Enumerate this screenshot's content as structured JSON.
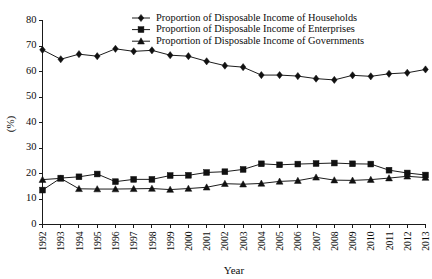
{
  "chart_data": {
    "type": "line",
    "title": "",
    "xlabel": "Year",
    "ylabel": "(%)",
    "grid": false,
    "legend_position": "top-center",
    "xlim": [
      1992,
      2013
    ],
    "ylim": [
      0,
      80
    ],
    "ytick_labels": [
      "0",
      "10",
      "20",
      "30",
      "40",
      "50",
      "60",
      "70",
      "80"
    ],
    "yticks": [
      0,
      10,
      20,
      30,
      40,
      50,
      60,
      70,
      80
    ],
    "categories": [
      "1992",
      "1993",
      "1994",
      "1995",
      "1996",
      "1997",
      "1998",
      "1999",
      "2000",
      "2001",
      "2002",
      "2003",
      "2004",
      "2005",
      "2006",
      "2007",
      "2008",
      "2009",
      "2010",
      "2011",
      "2012",
      "2013"
    ],
    "x": [
      1992,
      1993,
      1994,
      1995,
      1996,
      1997,
      1998,
      1999,
      2000,
      2001,
      2002,
      2003,
      2004,
      2005,
      2006,
      2007,
      2008,
      2009,
      2010,
      2011,
      2012,
      2013
    ],
    "series": [
      {
        "name": "Proportion of Disposable Income of Households",
        "marker": "diamond",
        "color": "#111111",
        "values": [
          68.5,
          64.8,
          66.8,
          66.0,
          68.9,
          67.9,
          68.3,
          66.4,
          66.0,
          64.0,
          62.3,
          61.7,
          58.6,
          58.6,
          58.2,
          57.2,
          56.7,
          58.5,
          58.1,
          59.1,
          59.5,
          60.8
        ]
      },
      {
        "name": "Proportion of Disposable Income of Enterprises",
        "marker": "square",
        "color": "#111111",
        "values": [
          13.5,
          18.2,
          18.7,
          19.8,
          16.8,
          17.7,
          17.7,
          19.2,
          19.3,
          20.4,
          20.7,
          21.6,
          23.8,
          23.4,
          23.7,
          23.9,
          24.1,
          23.8,
          23.7,
          21.3,
          20.2,
          19.4
        ]
      },
      {
        "name": "Proportion of Disposable Income of Governments",
        "marker": "triangle",
        "color": "#111111",
        "values": [
          17.6,
          18.1,
          14.0,
          13.9,
          13.9,
          14.0,
          14.1,
          13.7,
          14.1,
          14.6,
          16.0,
          15.8,
          16.1,
          16.9,
          17.2,
          18.5,
          17.4,
          17.3,
          17.6,
          18.2,
          18.9,
          18.4
        ]
      }
    ]
  }
}
